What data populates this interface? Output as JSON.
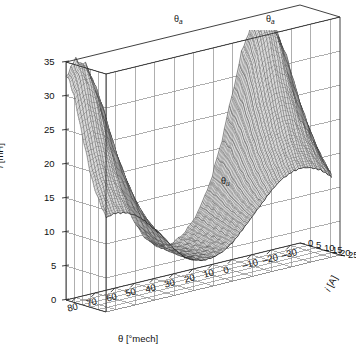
{
  "figure": {
    "type": "3d-surface-mesh"
  },
  "axes": {
    "z": {
      "label": "l [mH]",
      "label_symbol": "l",
      "label_unit": "[mH]",
      "ticks": [
        0,
        5,
        10,
        15,
        20,
        25,
        30,
        35
      ],
      "range": [
        0,
        35
      ]
    },
    "x": {
      "label": "θ [°mech]",
      "label_symbol": "θ",
      "label_unit": "[°mech]",
      "ticks": [
        80,
        70,
        60,
        50,
        40,
        30,
        20,
        10,
        0,
        -10,
        -20,
        -30
      ],
      "tick_labels": [
        "80",
        "70",
        "60",
        "50",
        "40",
        "30",
        "20",
        "10",
        "0",
        "–10",
        "–20",
        "–30"
      ],
      "range": [
        85,
        -35
      ]
    },
    "y": {
      "label": "i [A]",
      "label_symbol": "i",
      "label_unit": "[A]",
      "ticks": [
        0,
        5,
        10,
        15,
        20,
        25
      ],
      "range": [
        0,
        25
      ]
    }
  },
  "annotations": [
    {
      "id": "theta-a-left",
      "text": "θ",
      "sub": "a",
      "x": 174,
      "y": 14
    },
    {
      "id": "theta-a-right",
      "text": "θ",
      "sub": "a",
      "x": 266,
      "y": 14
    },
    {
      "id": "theta-u",
      "text": "θ",
      "sub": "u",
      "x": 221,
      "y": 176
    }
  ],
  "style": {
    "background": "#ffffff",
    "mesh_color": "#3a3a3a",
    "grid_color": "#8d8d8d",
    "axis_color": "#2b2b2b",
    "surface_fill": "#d8d8d8",
    "text_color": "#111111"
  },
  "chart_data": {
    "type": "surface",
    "title": "",
    "xlabel": "θ [°mech]",
    "ylabel": "i [A]",
    "zlabel": "l [mH]",
    "xlim": [
      -35,
      85
    ],
    "ylim": [
      0,
      25
    ],
    "zlim": [
      0,
      35
    ],
    "grid": true,
    "legend": "none",
    "x_ticks": [
      80,
      70,
      60,
      50,
      40,
      30,
      20,
      10,
      0,
      -10,
      -20,
      -30
    ],
    "y_ticks": [
      0,
      5,
      10,
      15,
      20,
      25
    ],
    "z_ticks": [
      0,
      5,
      10,
      15,
      20,
      25,
      30,
      35
    ],
    "aligned_positions_deg": [
      60,
      0
    ],
    "unaligned_position_deg": 30,
    "peak_inductance_mH": 35,
    "min_inductance_mH": 4,
    "annotations": [
      {
        "label": "θa",
        "meaning": "aligned rotor position",
        "count": 2
      },
      {
        "label": "θu",
        "meaning": "unaligned rotor position",
        "count": 1
      }
    ],
    "x": [
      -35,
      -30,
      -25,
      -20,
      -15,
      -10,
      -5,
      0,
      5,
      10,
      15,
      20,
      25,
      30,
      35,
      40,
      45,
      50,
      55,
      60,
      65,
      70,
      75,
      80,
      85
    ],
    "y": [
      0,
      2.5,
      5,
      7.5,
      10,
      12.5,
      15,
      17.5,
      20,
      22.5,
      25
    ],
    "z_by_current": [
      {
        "i": 0,
        "values": [
          18,
          24,
          30,
          34,
          35,
          34,
          30,
          24,
          18,
          13,
          9.5,
          7,
          5.5,
          4.6,
          4.4,
          5,
          6.5,
          9,
          13,
          18,
          24,
          30,
          34,
          35,
          33
        ]
      },
      {
        "i": 2.5,
        "values": [
          17.5,
          23,
          29,
          33,
          34,
          33,
          29,
          23,
          17.5,
          12.7,
          9.3,
          6.9,
          5.4,
          4.6,
          4.4,
          4.9,
          6.4,
          8.8,
          12.7,
          17.5,
          23,
          29,
          33,
          34,
          32
        ]
      },
      {
        "i": 5,
        "values": [
          17,
          22,
          27.5,
          31,
          32,
          31,
          27.5,
          22,
          17,
          12.3,
          9,
          6.8,
          5.3,
          4.5,
          4.4,
          4.8,
          6.2,
          8.5,
          12.3,
          17,
          22,
          27.5,
          31,
          32,
          30.5
        ]
      },
      {
        "i": 7.5,
        "values": [
          16,
          20.5,
          25,
          28,
          29,
          28,
          25,
          20.5,
          16,
          11.8,
          8.8,
          6.6,
          5.2,
          4.5,
          4.3,
          4.8,
          6,
          8.2,
          11.8,
          16,
          20.5,
          25,
          28,
          29,
          28
        ]
      },
      {
        "i": 10,
        "values": [
          15,
          19,
          22.5,
          25,
          26,
          25,
          22.5,
          19,
          15,
          11.2,
          8.5,
          6.4,
          5.1,
          4.4,
          4.3,
          4.7,
          5.9,
          7.9,
          11.2,
          15,
          19,
          22.5,
          25,
          26,
          25
        ]
      },
      {
        "i": 12.5,
        "values": [
          14,
          17.5,
          20.5,
          22.5,
          23.2,
          22.5,
          20.5,
          17.5,
          14,
          10.7,
          8.2,
          6.3,
          5,
          4.4,
          4.3,
          4.7,
          5.8,
          7.6,
          10.7,
          14,
          17.5,
          20.5,
          22.5,
          23.2,
          22.5
        ]
      },
      {
        "i": 15,
        "values": [
          13,
          16,
          18.5,
          20,
          20.7,
          20,
          18.5,
          16,
          13,
          10.2,
          8,
          6.1,
          4.9,
          4.3,
          4.2,
          4.6,
          5.7,
          7.4,
          10.2,
          13,
          16,
          18.5,
          20,
          20.7,
          20
        ]
      },
      {
        "i": 17.5,
        "values": [
          12.2,
          14.8,
          16.8,
          18,
          18.6,
          18,
          16.8,
          14.8,
          12.2,
          9.8,
          7.8,
          6,
          4.9,
          4.3,
          4.2,
          4.6,
          5.6,
          7.2,
          9.8,
          12.2,
          14.8,
          16.8,
          18,
          18.6,
          18
        ]
      },
      {
        "i": 20,
        "values": [
          11.5,
          13.7,
          15.4,
          16.4,
          16.9,
          16.4,
          15.4,
          13.7,
          11.5,
          9.4,
          7.6,
          5.9,
          4.8,
          4.3,
          4.2,
          4.6,
          5.5,
          7,
          9.4,
          11.5,
          13.7,
          15.4,
          16.4,
          16.9,
          16.4
        ]
      },
      {
        "i": 22.5,
        "values": [
          10.9,
          12.8,
          14.2,
          15,
          15.4,
          15,
          14.2,
          12.8,
          10.9,
          9.1,
          7.4,
          5.8,
          4.8,
          4.2,
          4.2,
          4.5,
          5.4,
          6.9,
          9.1,
          10.9,
          12.8,
          14.2,
          15,
          15.4,
          15
        ]
      },
      {
        "i": 25,
        "values": [
          10.4,
          12,
          13.2,
          13.9,
          14.2,
          13.9,
          13.2,
          12,
          10.4,
          8.8,
          7.2,
          5.7,
          4.7,
          4.2,
          4.1,
          4.5,
          5.3,
          6.8,
          8.8,
          10.4,
          12,
          13.2,
          13.9,
          14.2,
          13.9
        ]
      }
    ]
  }
}
